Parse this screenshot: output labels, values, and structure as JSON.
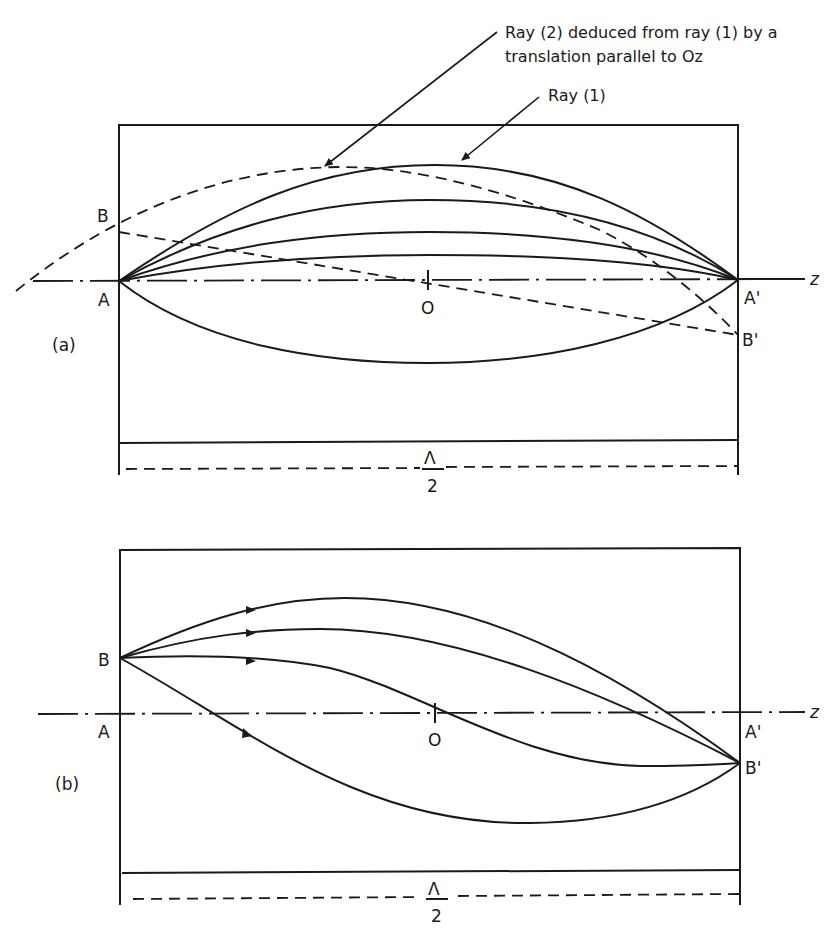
{
  "figure": {
    "panel_a": {
      "label": "(a)",
      "annotations": {
        "ray2_line1": "Ray (2) deduced from ray (1) by a",
        "ray2_line2": "translation parallel to Oz",
        "ray1": "Ray (1)"
      },
      "points": {
        "A": "A",
        "A_prime": "A'",
        "B": "B",
        "B_prime": "B'",
        "O": "O"
      },
      "axis_label": "z",
      "span_numerator": "Λ",
      "span_denominator": "2"
    },
    "panel_b": {
      "label": "(b)",
      "points": {
        "A": "A",
        "A_prime": "A'",
        "B": "B",
        "B_prime": "B'",
        "O": "O"
      },
      "axis_label": "z",
      "span_numerator": "Λ",
      "span_denominator": "2"
    }
  }
}
